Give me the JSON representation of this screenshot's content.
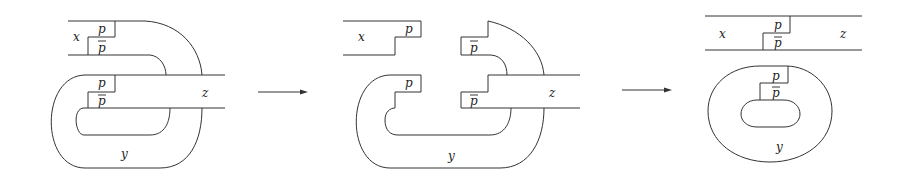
{
  "figure": {
    "panels": [
      {
        "id": "before",
        "labels": {
          "x": "x",
          "y": "y",
          "z": "z",
          "p_top": "p",
          "pbar_top": "p",
          "p_mid": "p",
          "pbar_mid": "p"
        }
      },
      {
        "id": "cut",
        "labels": {
          "x": "x",
          "y": "y",
          "z": "z",
          "p_top": "p",
          "pbar_top": "p",
          "p_mid": "p",
          "pbar_mid": "p"
        }
      },
      {
        "id": "after",
        "labels": {
          "x": "x",
          "y": "y",
          "z": "z",
          "p_top": "p",
          "pbar_top": "p",
          "p_mid": "p",
          "pbar_mid": "p"
        }
      }
    ],
    "arrows": [
      {
        "from": "before",
        "to": "cut"
      },
      {
        "from": "cut",
        "to": "after"
      }
    ],
    "colors": {
      "stroke": "#333333",
      "background": "#ffffff"
    }
  }
}
